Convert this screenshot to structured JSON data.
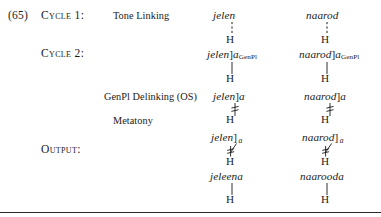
{
  "example": {
    "number": "(65)"
  },
  "stage_labels": {
    "cycle1": "Cycle 1:",
    "cycle2": "Cycle 2:",
    "output": "Output:"
  },
  "rules": {
    "tone_linking": "Tone Linking",
    "genpl_delinking": "GenPl Delinking (OS)",
    "metatony": "Metatony"
  },
  "tone": {
    "high": "H"
  },
  "columns": [
    {
      "name": "jelen",
      "rows": {
        "tone_linking": {
          "stem": "jelen",
          "bracket": "",
          "suffix": "",
          "subscript": ""
        },
        "cycle2": {
          "stem": "jelen",
          "bracket": "]",
          "suffix": "a",
          "subscript": "GenPl"
        },
        "genpl_delinking": {
          "stem": "jelen",
          "bracket": "]",
          "suffix": "a",
          "subscript": ""
        },
        "metatony": {
          "stem": "jelen",
          "bracket": "]",
          "suffix": "",
          "subscript_italic": "a"
        },
        "output": {
          "stem": "jeleena",
          "bracket": "",
          "suffix": "",
          "subscript": ""
        }
      }
    },
    {
      "name": "naarod",
      "rows": {
        "tone_linking": {
          "stem": "naarod",
          "bracket": "",
          "suffix": "",
          "subscript": ""
        },
        "cycle2": {
          "stem": "naarod",
          "bracket": "]",
          "suffix": "a",
          "subscript": "GenPl"
        },
        "genpl_delinking": {
          "stem": "naarod",
          "bracket": "]",
          "suffix": "a",
          "subscript": ""
        },
        "metatony": {
          "stem": "naarod",
          "bracket": "]",
          "suffix": "",
          "subscript_italic": "a"
        },
        "output": {
          "stem": "naarooda",
          "bracket": "",
          "suffix": "",
          "subscript": ""
        }
      }
    }
  ],
  "association_lines": {
    "tone_linking": "dashed-vertical",
    "cycle2": "solid-vertical",
    "genpl_delinking": "delinked-vertical",
    "metatony": "delinked-diagonal",
    "output": "solid-vertical"
  },
  "colors": {
    "ink": "#1a1a1a",
    "rule": "#2b2b2b"
  }
}
